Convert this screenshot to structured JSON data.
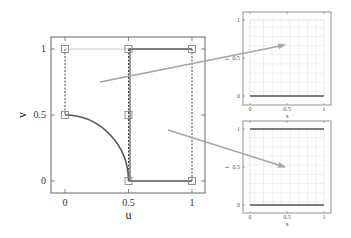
{
  "main_plot": {
    "xlabel": "u",
    "ylabel": "v",
    "xticks": [
      "0",
      "0.5",
      "1"
    ],
    "yticks": [
      "0",
      "0.5",
      "1"
    ],
    "control_points": [
      {
        "u": 0,
        "v": 1
      },
      {
        "u": 0.5,
        "v": 1
      },
      {
        "u": 1,
        "v": 1
      },
      {
        "u": 0,
        "v": 0.5
      },
      {
        "u": 0.5,
        "v": 0.5
      },
      {
        "u": 0.5,
        "v": 0
      },
      {
        "u": 1,
        "v": 0
      }
    ]
  },
  "top_right_plot": {
    "xlabel": "s",
    "ylabel": "t",
    "xticks": [
      "0",
      "0.5",
      "1"
    ],
    "yticks": [
      "0",
      "0.5",
      "1"
    ],
    "boundary_lines": [
      "t = 0"
    ]
  },
  "bottom_right_plot": {
    "xlabel": "s",
    "ylabel": "t",
    "xticks": [
      "0",
      "0.5",
      "1"
    ],
    "yticks": [
      "0",
      "0.5",
      "1"
    ],
    "boundary_lines": [
      "t = 0",
      "t = 1"
    ]
  },
  "colors": {
    "frame": "#555555",
    "curve": "#555555",
    "grid": "#cfcfcf",
    "arrow": "#a6a6a6",
    "square": "#888888"
  }
}
